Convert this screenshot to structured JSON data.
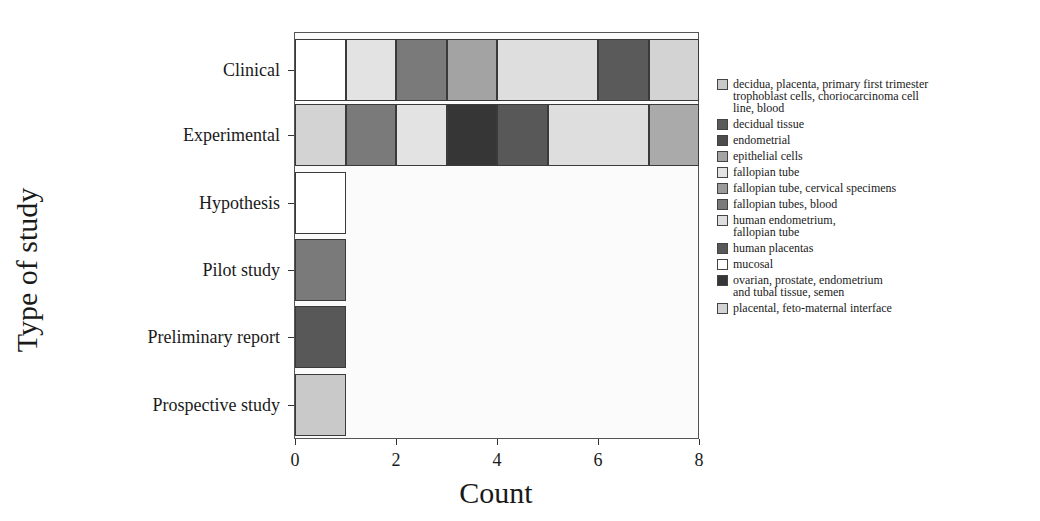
{
  "chart_data": {
    "type": "bar",
    "orientation": "horizontal",
    "stacked": true,
    "xlabel": "Count",
    "ylabel": "Type of study",
    "xlim": [
      0,
      8
    ],
    "xticks": [
      "0",
      "2",
      "4",
      "6",
      "8"
    ],
    "categories": [
      "Clinical",
      "Experimental",
      "Hypothesis",
      "Pilot study",
      "Preliminary report",
      "Prospective study"
    ],
    "legend_position": "right",
    "legend": [
      {
        "label": "decidua, placenta, primary first trimester\ntrophoblast cells, choriocarcinoma cell\nline, blood",
        "color": "#c9c9c9"
      },
      {
        "label": "decidual tissue",
        "color": "#5a5a5a"
      },
      {
        "label": "endometrial",
        "color": "#4d4d4d"
      },
      {
        "label": "epithelial cells",
        "color": "#a3a3a3"
      },
      {
        "label": "fallopian tube",
        "color": "#e3e3e3"
      },
      {
        "label": "fallopian tube, cervical specimens",
        "color": "#9a9a9a"
      },
      {
        "label": "fallopian tubes, blood",
        "color": "#7a7a7a"
      },
      {
        "label": "human endometrium,\nfallopian tube",
        "color": "#dedede"
      },
      {
        "label": "human placentas",
        "color": "#585858"
      },
      {
        "label": "mucosal",
        "color": "#ffffff"
      },
      {
        "label": "ovarian, prostate, endometrium\nand tubal tissue, semen",
        "color": "#363636"
      },
      {
        "label": "placental, feto-maternal interface",
        "color": "#d3d3d3"
      }
    ],
    "rows": [
      {
        "category": "Clinical",
        "segments": [
          {
            "label": "mucosal",
            "value": 1,
            "color": "#ffffff"
          },
          {
            "label": "fallopian tube",
            "value": 1,
            "color": "#e3e3e3"
          },
          {
            "label": "fallopian tubes, blood",
            "value": 1,
            "color": "#7a7a7a"
          },
          {
            "label": "epithelial cells",
            "value": 1,
            "color": "#a3a3a3"
          },
          {
            "label": "human endometrium, fallopian tube",
            "value": 2,
            "color": "#dedede"
          },
          {
            "label": "decidual tissue",
            "value": 1,
            "color": "#5a5a5a"
          },
          {
            "label": "placental, feto-maternal interface",
            "value": 1,
            "color": "#d3d3d3"
          }
        ]
      },
      {
        "category": "Experimental",
        "segments": [
          {
            "label": "placental, feto-maternal interface",
            "value": 1,
            "color": "#d3d3d3"
          },
          {
            "label": "fallopian tubes, blood",
            "value": 1,
            "color": "#7a7a7a"
          },
          {
            "label": "fallopian tube",
            "value": 1,
            "color": "#e3e3e3"
          },
          {
            "label": "ovarian, prostate, endometrium and tubal tissue, semen",
            "value": 1,
            "color": "#363636"
          },
          {
            "label": "human placentas",
            "value": 1,
            "color": "#585858"
          },
          {
            "label": "human endometrium, fallopian tube",
            "value": 2,
            "color": "#dedede"
          },
          {
            "label": "fallopian tube, cervical specimens",
            "value": 1,
            "color": "#aaaaaa"
          }
        ]
      },
      {
        "category": "Hypothesis",
        "segments": [
          {
            "label": "mucosal",
            "value": 1,
            "color": "#ffffff"
          }
        ]
      },
      {
        "category": "Pilot study",
        "segments": [
          {
            "label": "fallopian tubes, blood",
            "value": 1,
            "color": "#7a7a7a"
          }
        ]
      },
      {
        "category": "Preliminary report",
        "segments": [
          {
            "label": "human placentas",
            "value": 1,
            "color": "#585858"
          }
        ]
      },
      {
        "category": "Prospective study",
        "segments": [
          {
            "label": "decidua, placenta, primary first trimester trophoblast cells, choriocarcinoma cell line, blood",
            "value": 1,
            "color": "#c9c9c9"
          }
        ]
      }
    ],
    "totals": [
      8,
      8,
      1,
      1,
      1,
      1
    ],
    "grid": false
  }
}
